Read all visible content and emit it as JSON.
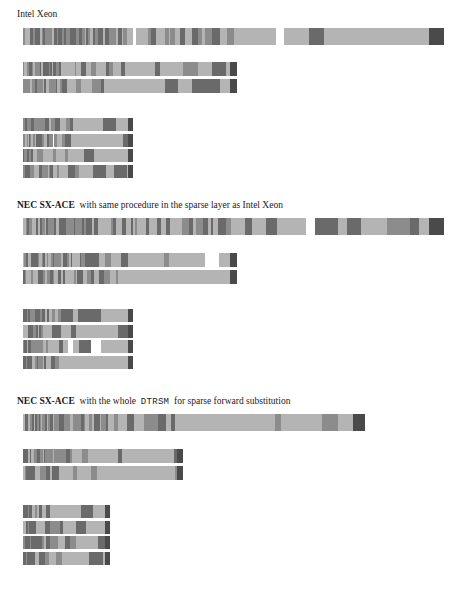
{
  "document": {
    "title": "Sparse forward substitution timeline bars",
    "background_color": "#ffffff",
    "palette": {
      "light": "#b4b4b4",
      "medium": "#8c8c8c",
      "dark": "#6a6a6a",
      "darkest": "#4a4a4a",
      "white_gap": "#ffffff",
      "text": "#1a1a1a"
    }
  },
  "sections": [
    {
      "id": "intel-xeon",
      "label_parts": [
        {
          "text": "Intel Xeon",
          "style": "serif"
        }
      ],
      "label_y": 8,
      "groups": [
        {
          "id": "xeon-row-1",
          "name": "single-wide-bar",
          "x": 23,
          "y": 28,
          "width": 421,
          "height": 17,
          "rows": 1,
          "segments": [
            {
              "x": 0,
              "w": 3,
              "c": "medium"
            },
            {
              "x": 3,
              "w": 2,
              "c": "dark"
            },
            {
              "x": 5,
              "w": 4,
              "c": "medium"
            },
            {
              "x": 9,
              "w": 2,
              "c": "dark"
            },
            {
              "x": 11,
              "w": 3,
              "c": "medium"
            },
            {
              "x": 14,
              "w": 2,
              "c": "dark"
            },
            {
              "x": 16,
              "w": 3,
              "c": "medium"
            },
            {
              "x": 19,
              "w": 3,
              "c": "dark"
            },
            {
              "x": 22,
              "w": 3,
              "c": "medium"
            },
            {
              "x": 25,
              "w": 2,
              "c": "dark"
            },
            {
              "x": 27,
              "w": 5,
              "c": "medium"
            },
            {
              "x": 32,
              "w": 2,
              "c": "dark"
            },
            {
              "x": 34,
              "w": 4,
              "c": "medium"
            },
            {
              "x": 38,
              "w": 2,
              "c": "light"
            },
            {
              "x": 40,
              "w": 2,
              "c": "dark"
            },
            {
              "x": 42,
              "w": 4,
              "c": "light"
            },
            {
              "x": 46,
              "w": 2,
              "c": "dark"
            },
            {
              "x": 48,
              "w": 1,
              "c": "white"
            },
            {
              "x": 49,
              "w": 3,
              "c": "light"
            },
            {
              "x": 52,
              "w": 2,
              "c": "dark"
            },
            {
              "x": 54,
              "w": 5,
              "c": "light"
            },
            {
              "x": 59,
              "w": 3,
              "c": "dark"
            },
            {
              "x": 62,
              "w": 4,
              "c": "light"
            },
            {
              "x": 66,
              "w": 2,
              "c": "dark"
            },
            {
              "x": 68,
              "w": 5,
              "c": "light"
            },
            {
              "x": 73,
              "w": 4,
              "c": "dark"
            },
            {
              "x": 77,
              "w": 4,
              "c": "light"
            },
            {
              "x": 81,
              "w": 2,
              "c": "dark"
            },
            {
              "x": 83,
              "w": 5,
              "c": "light"
            },
            {
              "x": 88,
              "w": 3,
              "c": "dark"
            },
            {
              "x": 91,
              "w": 8,
              "c": "light"
            },
            {
              "x": 99,
              "w": 2,
              "c": "dark"
            },
            {
              "x": 101,
              "w": 6,
              "c": "light"
            },
            {
              "x": 107,
              "w": 6,
              "c": "dark"
            },
            {
              "x": 113,
              "w": 9,
              "c": "light"
            },
            {
              "x": 122,
              "w": 3,
              "c": "dark"
            },
            {
              "x": 125,
              "w": 11,
              "c": "light"
            },
            {
              "x": 136,
              "w": 6,
              "c": "dark"
            },
            {
              "x": 142,
              "w": 14,
              "c": "light"
            },
            {
              "x": 156,
              "w": 5,
              "c": "dark"
            },
            {
              "x": 161,
              "w": 18,
              "c": "light"
            },
            {
              "x": 179,
              "w": 7,
              "c": "dark"
            },
            {
              "x": 186,
              "w": 20,
              "c": "light"
            },
            {
              "x": 206,
              "w": 6,
              "c": "dark"
            },
            {
              "x": 212,
              "w": 18,
              "c": "light"
            },
            {
              "x": 230,
              "w": 9,
              "c": "dark"
            },
            {
              "x": 239,
              "w": 28,
              "c": "light"
            },
            {
              "x": 267,
              "w": 8,
              "c": "dark"
            },
            {
              "x": 275,
              "w": 30,
              "c": "light"
            },
            {
              "x": 305,
              "w": 13,
              "c": "dark"
            },
            {
              "x": 318,
              "w": 44,
              "c": "light"
            },
            {
              "x": 362,
              "w": 12,
              "c": "dark"
            },
            {
              "x": 374,
              "w": 20,
              "c": "light"
            },
            {
              "x": 394,
              "w": 13,
              "c": "dark"
            },
            {
              "x": 407,
              "w": 1,
              "c": "white"
            },
            {
              "x": 408,
              "w": 2,
              "c": "medium"
            },
            {
              "x": 410,
              "w": 0,
              "c": "light"
            },
            {
              "x": 410,
              "w": 1,
              "c": "light"
            },
            {
              "x": 396,
              "w": 0,
              "c": "light"
            }
          ],
          "tail": {
            "x": 400,
            "w": 21,
            "c": "darkest"
          }
        },
        {
          "id": "xeon-rows-2",
          "name": "two-bar-stack",
          "x": 23,
          "y": 62,
          "width": 214,
          "height": 14,
          "gap": 3,
          "rows": 2
        },
        {
          "id": "xeon-rows-4",
          "name": "four-bar-stack",
          "x": 23,
          "y": 118,
          "width": 110,
          "height": 13,
          "gap": 2.5,
          "rows": 4
        }
      ]
    },
    {
      "id": "nec-sx-ace-same-procedure",
      "label_parts": [
        {
          "text": "NEC SX-ACE",
          "style": "serif"
        },
        {
          "text": "with same procedure in the sparse layer as Intel Xeon",
          "style": "serif"
        }
      ],
      "label_y": 199,
      "groups": [
        {
          "id": "sxace1-row-1",
          "name": "single-wide-bar",
          "x": 23,
          "y": 218,
          "width": 421,
          "height": 17,
          "rows": 1
        },
        {
          "id": "sxace1-rows-2",
          "name": "two-bar-stack",
          "x": 23,
          "y": 253,
          "width": 214,
          "height": 14,
          "gap": 3,
          "rows": 2
        },
        {
          "id": "sxace1-rows-4",
          "name": "four-bar-stack",
          "x": 23,
          "y": 309,
          "width": 110,
          "height": 13,
          "gap": 2.5,
          "rows": 4
        }
      ]
    },
    {
      "id": "nec-sx-ace-whole-dtrsm",
      "label_parts": [
        {
          "text": "NEC SX-ACE",
          "style": "serif"
        },
        {
          "text": "with the whole",
          "style": "serif"
        },
        {
          "text": "DTRSM",
          "style": "mono"
        },
        {
          "text": "for sparse forward substitution",
          "style": "serif"
        }
      ],
      "label_y": 395,
      "groups": [
        {
          "id": "sxace2-row-1",
          "name": "single-wide-bar",
          "x": 23,
          "y": 414,
          "width": 342,
          "height": 17,
          "rows": 1
        },
        {
          "id": "sxace2-rows-2",
          "name": "two-bar-stack",
          "x": 23,
          "y": 449,
          "width": 160,
          "height": 14,
          "gap": 3,
          "rows": 2
        },
        {
          "id": "sxace2-rows-4",
          "name": "four-bar-stack",
          "x": 23,
          "y": 505,
          "width": 87,
          "height": 13,
          "gap": 2.5,
          "rows": 4
        }
      ]
    }
  ],
  "labels": {
    "intel_xeon": "Intel Xeon",
    "nec_same_prefix": "NEC SX-ACE",
    "nec_same_rest": "with same procedure in the sparse layer as Intel Xeon",
    "nec_dtrsm_prefix": "NEC SX-ACE",
    "nec_dtrsm_mid": "with the whole",
    "nec_dtrsm_mono": "DTRSM",
    "nec_dtrsm_rest": "for sparse forward substitution"
  },
  "chart_data": {
    "type": "bar",
    "series": [
      {
        "name": "Intel Xeon",
        "bar_widths_px": [
          421,
          214,
          214,
          110,
          110,
          110,
          110
        ]
      },
      {
        "name": "NEC SX-ACE with same procedure in the sparse layer as Intel Xeon",
        "bar_widths_px": [
          421,
          214,
          214,
          110,
          110,
          110,
          110
        ]
      },
      {
        "name": "NEC SX-ACE with the whole DTRSM for sparse forward substitution",
        "bar_widths_px": [
          342,
          160,
          160,
          87,
          87,
          87,
          87
        ]
      }
    ],
    "xlabel": "",
    "ylabel": "",
    "grid": false,
    "legend": "none"
  }
}
